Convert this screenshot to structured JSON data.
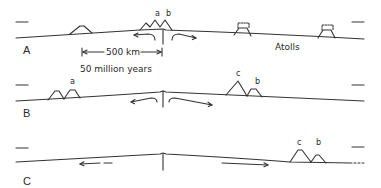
{
  "figure": {
    "type": "seafloor-spreading cross sections",
    "colors": {
      "line": "#333333",
      "background": "#ffffff"
    },
    "panels": [
      {
        "id": "A",
        "label": "A",
        "peak_labels": [
          "a",
          "b"
        ],
        "annotations": {
          "distance": "500 km",
          "time": "50 million years",
          "atolls": "Atolls"
        }
      },
      {
        "id": "B",
        "label": "B",
        "peak_labels": [
          "a",
          "c",
          "b"
        ]
      },
      {
        "id": "C",
        "label": "C",
        "peak_labels": [
          "c",
          "b"
        ]
      }
    ]
  }
}
